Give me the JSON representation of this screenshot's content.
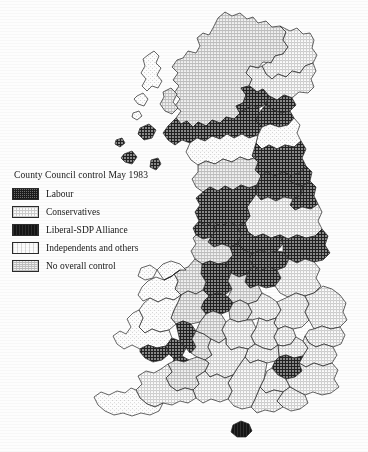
{
  "figure": {
    "title": "County Council control May 1983",
    "background_color": "#ffffff",
    "ink_color": "#1a1a1a"
  },
  "legend": {
    "title": "County Council control May 1983",
    "items": [
      {
        "label": "Labour",
        "pattern": "dark-crosshatch",
        "swatch_color": "#6e6e6e"
      },
      {
        "label": "Conservatives",
        "pattern": "light-grid-dot",
        "swatch_color": "#fbfbfb"
      },
      {
        "label": "Liberal-SDP Alliance",
        "pattern": "solid-black",
        "swatch_color": "#141414"
      },
      {
        "label": "Independents and others",
        "pattern": "very-light-stipple",
        "swatch_color": "#fcfcfc"
      },
      {
        "label": "No overall control",
        "pattern": "medium-stipple",
        "swatch_color": "#f2f2f2"
      }
    ]
  },
  "map": {
    "regions": [
      {
        "name": "Highland",
        "control": "No overall control"
      },
      {
        "name": "Western Isles",
        "control": "Independents and others"
      },
      {
        "name": "Orkney",
        "control": "Independents and others"
      },
      {
        "name": "Grampian",
        "control": "Conservatives"
      },
      {
        "name": "Tayside",
        "control": "Conservatives"
      },
      {
        "name": "Central",
        "control": "Labour"
      },
      {
        "name": "Fife",
        "control": "Labour"
      },
      {
        "name": "Lothian",
        "control": "Labour"
      },
      {
        "name": "Strathclyde",
        "control": "Labour"
      },
      {
        "name": "Borders",
        "control": "Independents and others"
      },
      {
        "name": "Dumfries and Galloway",
        "control": "Independents and others"
      },
      {
        "name": "Northumberland",
        "control": "Labour"
      },
      {
        "name": "Cumbria",
        "control": "No overall control"
      },
      {
        "name": "Tyne and Wear",
        "control": "Labour"
      },
      {
        "name": "Durham",
        "control": "Labour"
      },
      {
        "name": "Cleveland",
        "control": "Labour"
      },
      {
        "name": "North Yorkshire",
        "control": "Conservatives"
      },
      {
        "name": "Lancashire",
        "control": "Labour"
      },
      {
        "name": "West Yorkshire",
        "control": "Labour"
      },
      {
        "name": "Humberside",
        "control": "Labour"
      },
      {
        "name": "Merseyside",
        "control": "Labour"
      },
      {
        "name": "Greater Manchester",
        "control": "Labour"
      },
      {
        "name": "South Yorkshire",
        "control": "Labour"
      },
      {
        "name": "Cheshire",
        "control": "No overall control"
      },
      {
        "name": "Derbyshire",
        "control": "Labour"
      },
      {
        "name": "Nottinghamshire",
        "control": "Labour"
      },
      {
        "name": "Lincolnshire",
        "control": "Conservatives"
      },
      {
        "name": "Staffordshire",
        "control": "Labour"
      },
      {
        "name": "Leicestershire",
        "control": "No overall control"
      },
      {
        "name": "Shropshire",
        "control": "No overall control"
      },
      {
        "name": "West Midlands",
        "control": "Labour"
      },
      {
        "name": "Warwickshire",
        "control": "No overall control"
      },
      {
        "name": "Northamptonshire",
        "control": "Conservatives"
      },
      {
        "name": "Cambridgeshire",
        "control": "Conservatives"
      },
      {
        "name": "Norfolk",
        "control": "Conservatives"
      },
      {
        "name": "Suffolk",
        "control": "Conservatives"
      },
      {
        "name": "Hereford and Worcester",
        "control": "No overall control"
      },
      {
        "name": "Gwynedd",
        "control": "Independents and others"
      },
      {
        "name": "Clwyd",
        "control": "Independents and others"
      },
      {
        "name": "Powys",
        "control": "Independents and others"
      },
      {
        "name": "Dyfed",
        "control": "Independents and others"
      },
      {
        "name": "West Glamorgan",
        "control": "Labour"
      },
      {
        "name": "Mid Glamorgan",
        "control": "Labour"
      },
      {
        "name": "South Glamorgan",
        "control": "Labour"
      },
      {
        "name": "Gwent",
        "control": "Labour"
      },
      {
        "name": "Avon",
        "control": "No overall control"
      },
      {
        "name": "Gloucestershire",
        "control": "No overall control"
      },
      {
        "name": "Oxfordshire",
        "control": "Conservatives"
      },
      {
        "name": "Buckinghamshire",
        "control": "Conservatives"
      },
      {
        "name": "Bedfordshire",
        "control": "Conservatives"
      },
      {
        "name": "Hertfordshire",
        "control": "Conservatives"
      },
      {
        "name": "Essex",
        "control": "Conservatives"
      },
      {
        "name": "Greater London",
        "control": "Labour"
      },
      {
        "name": "Berkshire",
        "control": "Conservatives"
      },
      {
        "name": "Surrey",
        "control": "Conservatives"
      },
      {
        "name": "Kent",
        "control": "Conservatives"
      },
      {
        "name": "East Sussex",
        "control": "Conservatives"
      },
      {
        "name": "West Sussex",
        "control": "Conservatives"
      },
      {
        "name": "Hampshire",
        "control": "Conservatives"
      },
      {
        "name": "Isle of Wight",
        "control": "Liberal-SDP Alliance"
      },
      {
        "name": "Wiltshire",
        "control": "Conservatives"
      },
      {
        "name": "Dorset",
        "control": "Conservatives"
      },
      {
        "name": "Somerset",
        "control": "No overall control"
      },
      {
        "name": "Devon",
        "control": "Conservatives"
      },
      {
        "name": "Cornwall",
        "control": "Independents and others"
      }
    ]
  }
}
